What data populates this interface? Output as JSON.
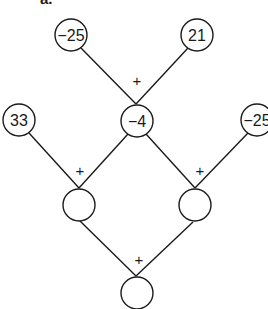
{
  "part_label": "a.",
  "nodes": {
    "top_left": "−25",
    "top_right": "21",
    "mid_left": "33",
    "mid_center": "−4",
    "mid_right": "−25",
    "low_left": "",
    "low_right": "",
    "bottom": ""
  },
  "operators": {
    "top": "+",
    "low_left": "+",
    "low_right": "+",
    "bottom": "+"
  },
  "colors": {
    "stroke": "#1a1a1a",
    "background": "#ffffff"
  }
}
